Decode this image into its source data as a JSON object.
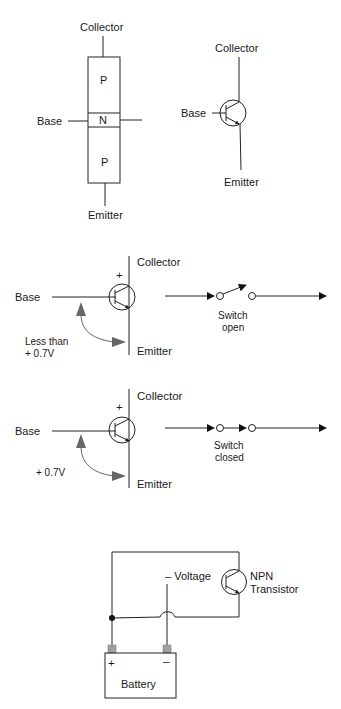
{
  "pnp_structure": {
    "collector_label": "Collector",
    "base_label": "Base",
    "emitter_label": "Emitter",
    "layers": [
      "P",
      "N",
      "P"
    ]
  },
  "transistor_symbol": {
    "collector_label": "Collector",
    "base_label": "Base",
    "emitter_label": "Emitter"
  },
  "switch_open_diagram": {
    "base_label": "Base",
    "collector_label": "Collector",
    "emitter_label": "Emitter",
    "polarity": "+",
    "voltage_label_line1": "Less than",
    "voltage_label_line2": "+ 0.7V",
    "switch_label_line1": "Switch",
    "switch_label_line2": "open"
  },
  "switch_closed_diagram": {
    "base_label": "Base",
    "collector_label": "Collector",
    "emitter_label": "Emitter",
    "polarity": "+",
    "voltage_label": "+ 0.7V",
    "switch_label_line1": "Switch",
    "switch_label_line2": "closed"
  },
  "battery_circuit": {
    "voltage_label": "– Voltage",
    "transistor_label_line1": "NPN",
    "transistor_label_line2": "Transistor",
    "battery_label": "Battery",
    "positive_terminal": "+",
    "negative_terminal": "–",
    "terminal_color": "#a0a0a0"
  }
}
